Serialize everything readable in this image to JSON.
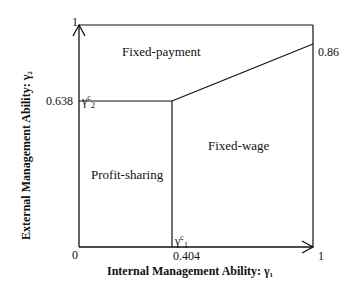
{
  "diagram": {
    "x_axis_title": "Internal Management Ability: γ₁",
    "y_axis_title": "External Management Ability: γ₂",
    "origin_label": "0",
    "x_max_label": "1",
    "y_max_label": "1",
    "x_threshold_value": "0.404",
    "y_threshold_value": "0.638",
    "right_edge_value": "0.86",
    "x_threshold_symbol": "γ",
    "x_threshold_sup": "c",
    "x_threshold_sub": "1",
    "y_threshold_symbol": "γ",
    "y_threshold_sup": "c",
    "y_threshold_sub": "2",
    "regions": [
      {
        "name": "Fixed-payment"
      },
      {
        "name": "Fixed-wage"
      },
      {
        "name": "Profit-sharing"
      }
    ]
  }
}
